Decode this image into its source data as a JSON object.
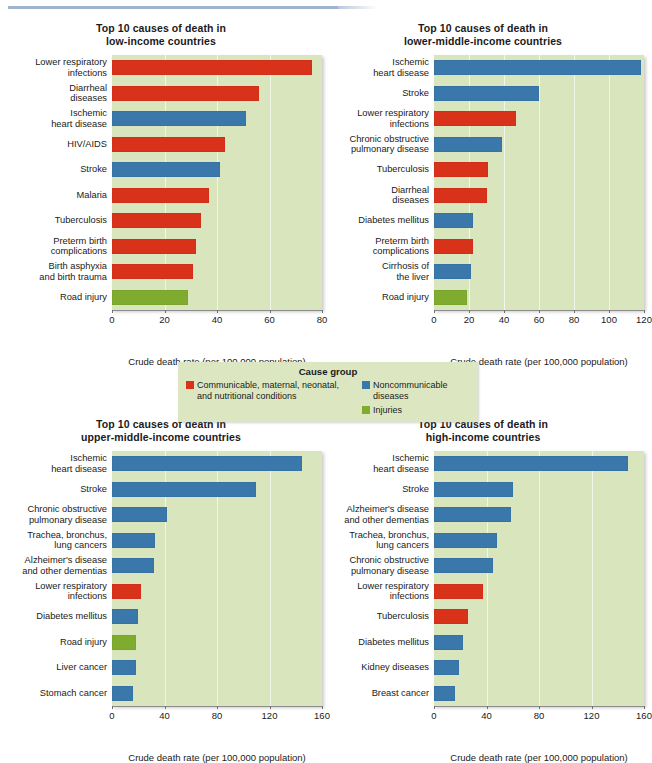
{
  "figure": {
    "axis_title": "Crude death rate (per 100,000 population)",
    "colors": {
      "communicable": "#d8321a",
      "noncommunicable": "#3a77ab",
      "injuries": "#7fac2f",
      "plot_background": "#d9e5bd",
      "gridline": "#f2f6e8",
      "legend_background": "#dce7c2",
      "top_rule": "#9fb4cd"
    }
  },
  "legend": {
    "title": "Cause group",
    "items": [
      {
        "label": "Communicable, maternal, neonatal,\nand nutritional conditions",
        "color": "#d8321a",
        "key": "communicable"
      },
      {
        "label": "Noncommunicable diseases",
        "color": "#3a77ab",
        "key": "noncommunicable"
      },
      {
        "label": "Injuries",
        "color": "#7fac2f",
        "key": "injuries"
      }
    ]
  },
  "chart_data": [
    {
      "type": "bar",
      "orientation": "horizontal",
      "title": "Top 10 causes of death in\nlow-income countries",
      "xlabel": "Crude death rate (per 100,000 population)",
      "ylabel": "",
      "xlim": [
        0,
        80
      ],
      "xticks": [
        0,
        20,
        40,
        60,
        80
      ],
      "grid": true,
      "legend_position": "figure-center",
      "categories": [
        "Lower respiratory\ninfections",
        "Diarrheal\ndiseases",
        "Ischemic\nheart disease",
        "HIV/AIDS",
        "Stroke",
        "Malaria",
        "Tuberculosis",
        "Preterm birth\ncomplications",
        "Birth asphyxia\nand birth trauma",
        "Road injury"
      ],
      "values": [
        76,
        56,
        51,
        43,
        41,
        37,
        34,
        32,
        31,
        29
      ],
      "groups": [
        "communicable",
        "communicable",
        "noncommunicable",
        "communicable",
        "noncommunicable",
        "communicable",
        "communicable",
        "communicable",
        "communicable",
        "injuries"
      ]
    },
    {
      "type": "bar",
      "orientation": "horizontal",
      "title": "Top 10 causes of death in\nlower-middle-income countries",
      "xlabel": "Crude death rate (per 100,000 population)",
      "ylabel": "",
      "xlim": [
        0,
        120
      ],
      "xticks": [
        0,
        20,
        40,
        60,
        80,
        100,
        120
      ],
      "grid": true,
      "categories": [
        "Ischemic\nheart disease",
        "Stroke",
        "Lower respiratory\ninfections",
        "Chronic obstructive\npulmonary disease",
        "Tuberculosis",
        "Diarrheal\ndiseases",
        "Diabetes mellitus",
        "Preterm birth\ncomplications",
        "Cirrhosis of\nthe liver",
        "Road injury"
      ],
      "values": [
        118,
        60,
        47,
        39,
        31,
        30,
        22,
        22,
        21,
        19
      ],
      "groups": [
        "noncommunicable",
        "noncommunicable",
        "communicable",
        "noncommunicable",
        "communicable",
        "communicable",
        "noncommunicable",
        "communicable",
        "noncommunicable",
        "injuries"
      ]
    },
    {
      "type": "bar",
      "orientation": "horizontal",
      "title": "Top 10 causes of death in\nupper-middle-income countries",
      "xlabel": "Crude death rate (per 100,000 population)",
      "ylabel": "",
      "xlim": [
        0,
        160
      ],
      "xticks": [
        0,
        40,
        80,
        120,
        160
      ],
      "grid": true,
      "categories": [
        "Ischemic\nheart disease",
        "Stroke",
        "Chronic obstructive\npulmonary disease",
        "Trachea, bronchus,\nlung cancers",
        "Alzheimer's disease\nand other dementias",
        "Lower respiratory\ninfections",
        "Diabetes mellitus",
        "Road injury",
        "Liver cancer",
        "Stomach cancer"
      ],
      "values": [
        145,
        110,
        42,
        33,
        32,
        22,
        20,
        18,
        18,
        16
      ],
      "groups": [
        "noncommunicable",
        "noncommunicable",
        "noncommunicable",
        "noncommunicable",
        "noncommunicable",
        "communicable",
        "noncommunicable",
        "injuries",
        "noncommunicable",
        "noncommunicable"
      ]
    },
    {
      "type": "bar",
      "orientation": "horizontal",
      "title": "Top 10 causes of death in\nhigh-income countries",
      "xlabel": "Crude death rate (per 100,000 population)",
      "ylabel": "",
      "xlim": [
        0,
        160
      ],
      "xticks": [
        0,
        40,
        80,
        120,
        160
      ],
      "grid": true,
      "categories": [
        "Ischemic\nheart disease",
        "Stroke",
        "Alzheimer's disease\nand other dementias",
        "Trachea, bronchus,\nlung cancers",
        "Chronic obstructive\npulmonary disease",
        "Lower respiratory\ninfections",
        "Tuberculosis",
        "Diabetes mellitus",
        "Kidney diseases",
        "Breast cancer"
      ],
      "values": [
        148,
        60,
        59,
        48,
        45,
        37,
        26,
        22,
        19,
        16
      ],
      "groups": [
        "noncommunicable",
        "noncommunicable",
        "noncommunicable",
        "noncommunicable",
        "noncommunicable",
        "communicable",
        "communicable",
        "noncommunicable",
        "noncommunicable",
        "noncommunicable"
      ]
    }
  ]
}
